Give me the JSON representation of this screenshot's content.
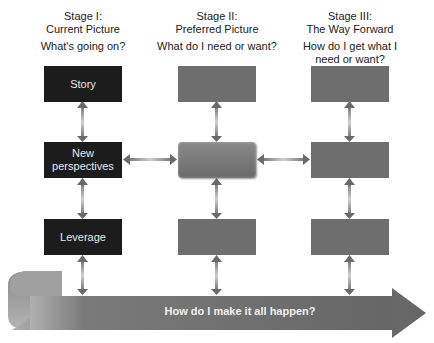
{
  "diagram": {
    "stages": [
      {
        "title": "Stage I:",
        "subtitle": "Current Picture",
        "question": "What's going on?"
      },
      {
        "title": "Stage II:",
        "subtitle": "Preferred Picture",
        "question": "What do I need or want?"
      },
      {
        "title": "Stage III:",
        "subtitle": "The Way Forward",
        "question": "How do I get what I need or want?"
      }
    ],
    "column1_boxes": [
      "Story",
      "New perspectives",
      "Leverage"
    ],
    "column2_boxes": [
      "",
      "",
      ""
    ],
    "column3_boxes": [
      "",
      "",
      ""
    ],
    "bottom_arrow_label": "How do I make it all happen?",
    "colors": {
      "dark_box": "#1c1c1c",
      "grey_box": "#6e6e6e",
      "arrow": "#7a7a7a",
      "band": "#6c6c6c"
    }
  }
}
